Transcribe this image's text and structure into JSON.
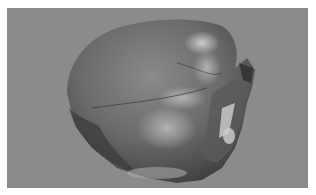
{
  "image": {
    "subject": "heart specimen",
    "alt": "Grayscale photograph of an excised heart on a gray background",
    "background_color": "#8b8b8b",
    "border_color": "#ffffff"
  }
}
